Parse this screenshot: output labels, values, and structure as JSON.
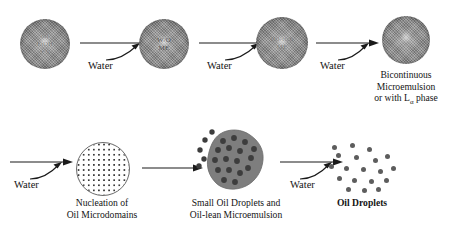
{
  "figure": {
    "type": "process-flow-diagram",
    "background_color": "#ffffff",
    "sphere_color": "#8e8e8e",
    "droplet_color": "#5d5d5d",
    "line_color": "#1a1a1a"
  },
  "top_row": {
    "stages": [
      {
        "id": "stage-1",
        "shape": "textured-sphere",
        "inner_label_lines": [
          "oil",
          "EtOH",
          "+ S"
        ],
        "caption": ""
      },
      {
        "id": "stage-2",
        "shape": "textured-sphere",
        "inner_label_lines": [
          "W/O",
          "ME"
        ],
        "caption": ""
      },
      {
        "id": "stage-3",
        "shape": "textured-sphere",
        "inner_label_lines": [
          "Oil-rich",
          "ME"
        ],
        "caption": ""
      },
      {
        "id": "stage-4",
        "shape": "textured-sphere",
        "inner_label_lines": [],
        "caption_lines": [
          "Bicontinuous",
          "Microemulsion",
          "or with Lα phase"
        ]
      }
    ],
    "arrows": [
      {
        "id": "arrow-1",
        "label": "Water",
        "style": "hooked"
      },
      {
        "id": "arrow-2",
        "label": "Water",
        "style": "hooked"
      },
      {
        "id": "arrow-3",
        "label": "Water",
        "style": "hooked"
      }
    ]
  },
  "bottom_row": {
    "stages": [
      {
        "id": "stage-5",
        "shape": "dotted-grid-circle",
        "caption_lines": [
          "Nucleation of",
          "Oil Microdomains"
        ],
        "bold": false
      },
      {
        "id": "stage-6",
        "shape": "irregular-blob-with-droplets",
        "caption_lines": [
          "Small Oil Droplets and",
          "Oil-lean  Microemulsion"
        ],
        "bold": false
      },
      {
        "id": "stage-7",
        "shape": "scattered-droplets",
        "caption_lines": [
          "Oil Droplets"
        ],
        "bold": true,
        "droplet_count": 19
      }
    ],
    "arrows": [
      {
        "id": "arrow-4",
        "label": "Water",
        "style": "hooked"
      },
      {
        "id": "arrow-5",
        "label": "",
        "style": "straight"
      },
      {
        "id": "arrow-6",
        "label": "Water",
        "style": "hooked"
      }
    ]
  }
}
